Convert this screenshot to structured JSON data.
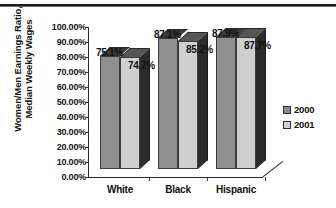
{
  "chart_data": {
    "type": "bar",
    "title": "",
    "subtitle": "",
    "xlabel": "",
    "ylabel": "Women/Men Earnings Ratio,\nMedian Weekly Wages",
    "categories": [
      "White",
      "Black",
      "Hispanic"
    ],
    "series": [
      {
        "name": "2000",
        "values": [
          75.1,
          74.7,
          87.1
        ],
        "color": "#8a8a8a"
      },
      {
        "name": "2001",
        "values": [
          74.7,
          85.2,
          87.7
        ],
        "color": "#c9c9c9"
      }
    ],
    "series_by_category": [
      {
        "category": "White",
        "2000": 75.1,
        "2001": 74.7
      },
      {
        "category": "Black",
        "2000": 87.1,
        "2001": 85.2
      },
      {
        "category": "Hispanic",
        "2000": 87.9,
        "2001": 87.7
      }
    ],
    "data_labels": [
      {
        "category": "White",
        "series": "2000",
        "text": "75.1%"
      },
      {
        "category": "White",
        "series": "2001",
        "text": "74.7%"
      },
      {
        "category": "Black",
        "series": "2000",
        "text": "87.1%"
      },
      {
        "category": "Black",
        "series": "2001",
        "text": "85.2%"
      },
      {
        "category": "Hispanic",
        "series": "2000",
        "text": "87.9%"
      },
      {
        "category": "Hispanic",
        "series": "2001",
        "text": "87.7%"
      }
    ],
    "ylim": [
      0,
      100
    ],
    "ytick_step": 10,
    "ytick_labels": [
      "100.00%",
      "90.00%",
      "80.00%",
      "70.00%",
      "60.00%",
      "50.00%",
      "40.00%",
      "30.00%",
      "20.00%",
      "10.00%",
      "0.00%"
    ],
    "ytick_values": [
      100,
      90,
      80,
      70,
      60,
      50,
      40,
      30,
      20,
      10,
      0
    ],
    "grid": false,
    "legend_position": "right",
    "legend": [
      "2000",
      "2001"
    ],
    "projection": "3d"
  },
  "legend": {
    "items": [
      {
        "label": "2000",
        "color": "#8a8a8a"
      },
      {
        "label": "2001",
        "color": "#d2d2d2"
      }
    ]
  },
  "axes": {
    "y_title_line1": "Women/Men Earnings Ratio,",
    "y_title_line2": "Median Weekly Wages"
  }
}
